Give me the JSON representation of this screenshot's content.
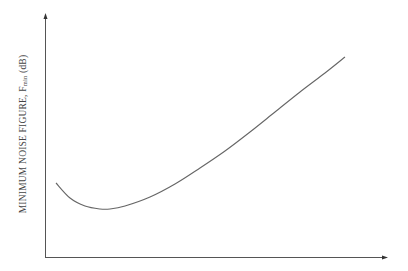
{
  "chart_data": {
    "type": "line",
    "title": "",
    "xlabel": "",
    "ylabel": "MINIMUM NOISE FIGURE, F",
    "ylabel_subscript": "min",
    "ylabel_unit": " (dB)",
    "grid": false,
    "legend": null,
    "axis_ticks": "none",
    "series": [
      {
        "name": "F_min",
        "points_px": [
          [
            56,
            183
          ],
          [
            70,
            198
          ],
          [
            85,
            206
          ],
          [
            100,
            209
          ],
          [
            110,
            209
          ],
          [
            125,
            206
          ],
          [
            150,
            197
          ],
          [
            175,
            184
          ],
          [
            200,
            168
          ],
          [
            225,
            151
          ],
          [
            250,
            132
          ],
          [
            275,
            112
          ],
          [
            300,
            92
          ],
          [
            325,
            73
          ],
          [
            345,
            57
          ]
        ]
      }
    ],
    "colors": {
      "axis": "#555555",
      "curve": "#666666",
      "text": "#444444"
    }
  }
}
